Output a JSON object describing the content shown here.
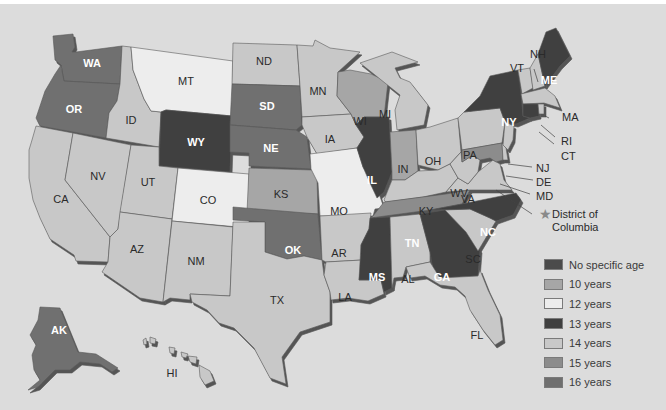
{
  "map": {
    "categories": {
      "none": {
        "label": "No specific age",
        "color": "#4b4b4b"
      },
      "y10": {
        "label": "10 years",
        "color": "#a6a6a6"
      },
      "y12": {
        "label": "12 years",
        "color": "#ededed"
      },
      "y13": {
        "label": "13 years",
        "color": "#3f3f3f"
      },
      "y14": {
        "label": "14 years",
        "color": "#c8c8c8"
      },
      "y15": {
        "label": "15 years",
        "color": "#8c8c8c"
      },
      "y16": {
        "label": "16 years",
        "color": "#6f6f6f"
      }
    },
    "legend": [
      {
        "key": "none",
        "label": "No specific age"
      },
      {
        "key": "y10",
        "label": "10 years"
      },
      {
        "key": "y12",
        "label": "12 years"
      },
      {
        "key": "y13",
        "label": "13 years"
      },
      {
        "key": "y14",
        "label": "14 years"
      },
      {
        "key": "y15",
        "label": "15 years"
      },
      {
        "key": "y16",
        "label": "16 years"
      }
    ],
    "states": {
      "WA": "y16",
      "OR": "y16",
      "CA": "y14",
      "NV": "y14",
      "ID": "y14",
      "MT": "y12",
      "WY": "y13",
      "UT": "y14",
      "AZ": "y14",
      "CO": "y12",
      "NM": "y14",
      "ND": "y14",
      "SD": "y16",
      "NE": "y16",
      "KS": "y10",
      "OK": "y16",
      "TX": "y14",
      "MN": "y14",
      "IA": "y14",
      "MO": "y12",
      "AR": "y14",
      "LA": "y14",
      "WI": "y10",
      "IL": "y13",
      "MS": "y13",
      "MI": "y14",
      "IN": "y10",
      "KY": "y14",
      "TN": "y15",
      "AL": "y14",
      "OH": "y14",
      "WV": "y14",
      "VA": "y14",
      "NC": "y13",
      "SC": "y14",
      "GA": "y13",
      "FL": "y14",
      "PA": "y14",
      "NY": "y13",
      "VT": "y14",
      "NH": "y14",
      "ME": "y13",
      "MA": "y14",
      "RI": "y14",
      "CT": "y13",
      "NJ": "y14",
      "DE": "y14",
      "MD": "y15",
      "AK": "y16",
      "HI": "y14"
    },
    "callouts": {
      "NH": "NH",
      "VT": "VT",
      "MA": "MA",
      "RI": "RI",
      "CT": "CT",
      "NJ": "NJ",
      "DE": "DE",
      "MD": "MD",
      "dc_line1": "District of",
      "dc_line2": "Columbia"
    },
    "labels": {
      "WA": "WA",
      "OR": "OR",
      "CA": "CA",
      "NV": "NV",
      "ID": "ID",
      "MT": "MT",
      "WY": "WY",
      "UT": "UT",
      "AZ": "AZ",
      "CO": "CO",
      "NM": "NM",
      "ND": "ND",
      "SD": "SD",
      "NE": "NE",
      "KS": "KS",
      "OK": "OK",
      "TX": "TX",
      "MN": "MN",
      "IA": "IA",
      "MO": "MO",
      "AR": "AR",
      "LA": "LA",
      "WI": "WI",
      "IL": "IL",
      "MS": "MS",
      "MI": "MI",
      "IN": "IN",
      "KY": "KY",
      "TN": "TN",
      "AL": "AL",
      "OH": "OH",
      "WV": "WV",
      "VA": "VA",
      "NC": "NC",
      "SC": "SC",
      "GA": "GA",
      "FL": "FL",
      "PA": "PA",
      "NY": "NY",
      "ME": "ME",
      "AK": "AK",
      "HI": "HI"
    }
  }
}
